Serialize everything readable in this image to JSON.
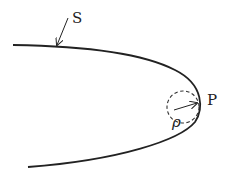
{
  "diagram": {
    "labels": {
      "curve": "S",
      "point": "P",
      "radius": "ρ"
    },
    "elements": {
      "curve": "parabola-like curve opening left, vertex at P",
      "osculating_circle": "dashed circle tangent at P",
      "radius_arrow": "arrow from circle center to P",
      "pointer_arrow": "arrow from label S to curve"
    },
    "colors": {
      "stroke": "#222222",
      "background": "#ffffff"
    }
  }
}
